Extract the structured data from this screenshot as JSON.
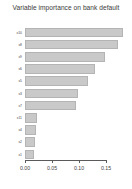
{
  "chart_data": {
    "type": "bar",
    "orientation": "horizontal",
    "title": "Variable importance on bank default",
    "xlabel": "",
    "ylabel": "",
    "xlim": [
      0.0,
      0.1925
    ],
    "xticks": [
      0.0,
      0.05,
      0.1,
      0.15
    ],
    "xticklabels": [
      "0.00",
      "0.05",
      "0.10",
      "0.15"
    ],
    "grid": false,
    "legend": false,
    "bar_color": "#c9c9c9",
    "bar_border_color": "#b4b4b4",
    "background_color": "#ffffff",
    "title_color": "#3a3a3a",
    "axis_color": "#5a5a5a",
    "categories": [
      "x10",
      "x8",
      "x9",
      "x6",
      "x5",
      "x3",
      "x7",
      "x11",
      "x4",
      "x2",
      "x1"
    ],
    "values": [
      0.181,
      0.172,
      0.148,
      0.13,
      0.117,
      0.098,
      0.095,
      0.022,
      0.021,
      0.019,
      0.016
    ],
    "bars": [
      {
        "label": "x10",
        "value": 0.181
      },
      {
        "label": "x8",
        "value": 0.172
      },
      {
        "label": "x9",
        "value": 0.148
      },
      {
        "label": "x6",
        "value": 0.13
      },
      {
        "label": "x5",
        "value": 0.117
      },
      {
        "label": "x3",
        "value": 0.098
      },
      {
        "label": "x7",
        "value": 0.095
      },
      {
        "label": "x11",
        "value": 0.022
      },
      {
        "label": "x4",
        "value": 0.021
      },
      {
        "label": "x2",
        "value": 0.019
      },
      {
        "label": "x1",
        "value": 0.016
      }
    ]
  }
}
